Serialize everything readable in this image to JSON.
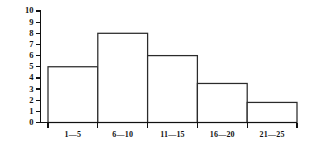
{
  "chart_data": {
    "type": "bar",
    "title": "",
    "subtitle": "",
    "xlabel": "",
    "ylabel": "",
    "categories": [
      "1—5",
      "6—10",
      "11—15",
      "16—20",
      "21—25"
    ],
    "values": [
      5,
      8,
      6,
      3.5,
      1.8
    ],
    "series": [
      {
        "name": "frequency",
        "values": [
          5,
          8,
          6,
          3.5,
          1.8
        ]
      }
    ],
    "ylim": [
      0,
      10
    ],
    "y_ticks": [
      0,
      1,
      2,
      3,
      4,
      5,
      6,
      7,
      8,
      9,
      10
    ],
    "y_tick_labels": [
      "0",
      "1",
      "2",
      "3",
      "4",
      "5",
      "6",
      "7",
      "8",
      "9",
      "10"
    ],
    "x_tick_labels": [
      "1—5",
      "6—10",
      "11—15",
      "16—20",
      "21—25"
    ],
    "grid": false,
    "legend": null,
    "legend_position": "none",
    "annotations": [],
    "bar_fill_color": "#ffffff",
    "bar_stroke_color": "#2b2b2b",
    "axis_color": "#111111",
    "background_color": "#ffffff"
  },
  "axes": {
    "y_axis_name": "frequency-axis",
    "x_axis_name": "class-interval-axis"
  }
}
